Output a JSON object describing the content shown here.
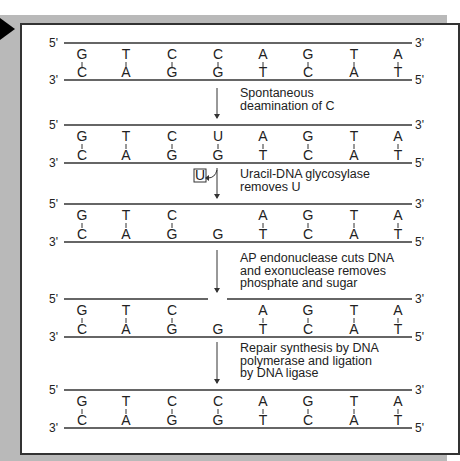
{
  "columns_x": [
    82,
    126,
    172,
    218,
    263,
    308,
    354,
    398
  ],
  "strands": [
    {
      "top_y": 43,
      "bottom_y": 80,
      "top": [
        "G",
        "T",
        "C",
        "C",
        "A",
        "G",
        "T",
        "A"
      ],
      "bottom": [
        "C",
        "A",
        "G",
        "G",
        "T",
        "C",
        "A",
        "T"
      ],
      "paired": [
        1,
        1,
        1,
        1,
        1,
        1,
        1,
        1
      ],
      "gap": false
    },
    {
      "top_y": 125,
      "bottom_y": 163,
      "top": [
        "G",
        "T",
        "C",
        "U",
        "A",
        "G",
        "T",
        "A"
      ],
      "bottom": [
        "C",
        "A",
        "G",
        "G",
        "T",
        "C",
        "A",
        "T"
      ],
      "paired": [
        1,
        1,
        1,
        1,
        1,
        1,
        1,
        1
      ],
      "gap": false
    },
    {
      "top_y": 204,
      "bottom_y": 242,
      "top": [
        "G",
        "T",
        "C",
        "",
        "A",
        "G",
        "T",
        "A"
      ],
      "bottom": [
        "C",
        "A",
        "G",
        "G",
        "T",
        "C",
        "A",
        "T"
      ],
      "paired": [
        1,
        1,
        1,
        0,
        1,
        1,
        1,
        1
      ],
      "gap": false
    },
    {
      "top_y": 299,
      "bottom_y": 337,
      "top": [
        "G",
        "T",
        "C",
        "",
        "A",
        "G",
        "T",
        "A"
      ],
      "bottom": [
        "C",
        "A",
        "G",
        "G",
        "T",
        "C",
        "A",
        "T"
      ],
      "paired": [
        1,
        1,
        1,
        0,
        1,
        1,
        1,
        1
      ],
      "gap": true
    },
    {
      "top_y": 390,
      "bottom_y": 428,
      "top": [
        "G",
        "T",
        "C",
        "C",
        "A",
        "G",
        "T",
        "A"
      ],
      "bottom": [
        "C",
        "A",
        "G",
        "G",
        "T",
        "C",
        "A",
        "T"
      ],
      "paired": [
        1,
        1,
        1,
        1,
        1,
        1,
        1,
        1
      ],
      "gap": false
    }
  ],
  "end_labels": {
    "five_prime": "5'",
    "three_prime": "3'"
  },
  "steps": [
    {
      "lines": [
        "Spontaneous",
        "deamination of C"
      ],
      "y": 97
    },
    {
      "lines": [
        "Uracil-DNA glycosylase",
        "removes U"
      ],
      "y": 178
    },
    {
      "lines": [
        "AP endonuclease cuts DNA",
        "and exonuclease removes",
        "phosphate and sugar"
      ],
      "y": 262
    },
    {
      "lines": [
        "Repair synthesis by DNA",
        "polymerase and ligation",
        "by DNA ligase"
      ],
      "y": 352
    }
  ],
  "arrows": [
    {
      "y1": 88,
      "y2": 118
    },
    {
      "y1": 168,
      "y2": 198
    },
    {
      "y1": 250,
      "y2": 292
    },
    {
      "y1": 342,
      "y2": 383
    }
  ],
  "removed_base": {
    "label": "U",
    "x": 200,
    "y": 177
  }
}
